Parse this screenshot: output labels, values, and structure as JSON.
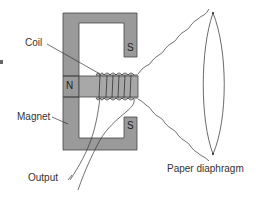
{
  "diagram": {
    "labels": {
      "coil": "Coil",
      "magnet": "Magnet",
      "output": "Output",
      "diaphragm": "Paper diaphragm"
    },
    "poles": {
      "north": "N",
      "south_top": "S",
      "south_bottom": "S"
    },
    "edge_fragment": "f",
    "colors": {
      "magnet_fill": "#9a9a9a",
      "core_fill": "#a8a8a8",
      "line": "#333333",
      "background": "#ffffff"
    }
  }
}
